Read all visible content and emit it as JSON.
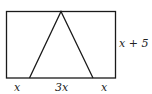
{
  "diagram": {
    "labels": {
      "bottom_left": "x",
      "bottom_middle": "3x",
      "bottom_right": "x",
      "right_side": "x + 5"
    },
    "colors": {
      "stroke": "#1a1a1a",
      "background": "#ffffff"
    }
  }
}
